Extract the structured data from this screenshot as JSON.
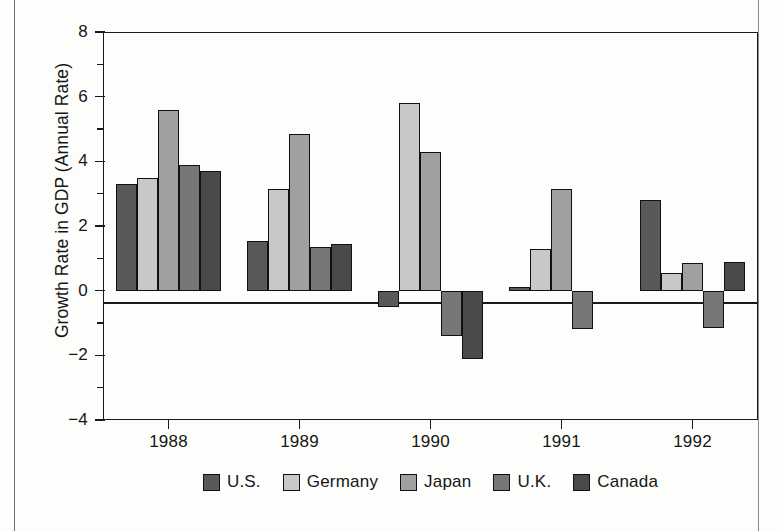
{
  "chart_data": {
    "type": "bar",
    "title": "",
    "xlabel": "",
    "ylabel": "Growth Rate in GDP (Annual Rate)",
    "categories": [
      "1988",
      "1989",
      "1990",
      "1991",
      "1992"
    ],
    "ylim": [
      -4,
      8
    ],
    "y_major_ticks": [
      "8",
      "6",
      "4",
      "2",
      "0",
      "−2",
      "−4"
    ],
    "y_major_values": [
      8,
      6,
      4,
      2,
      0,
      -2,
      -4
    ],
    "y_minor_values": [
      7,
      5,
      3,
      1,
      -1,
      -3
    ],
    "grid": false,
    "legend_position": "bottom",
    "zero_line": true,
    "series": [
      {
        "name": "U.S.",
        "color": "#595959",
        "values": [
          3.3,
          1.55,
          -0.5,
          0.1,
          2.8
        ]
      },
      {
        "name": "Germany",
        "color": "#c8c8c8",
        "values": [
          3.5,
          3.15,
          5.8,
          1.3,
          0.55
        ]
      },
      {
        "name": "Japan",
        "color": "#a0a0a0",
        "values": [
          5.6,
          4.85,
          4.3,
          3.15,
          0.85
        ]
      },
      {
        "name": "U.K.",
        "color": "#777777",
        "values": [
          3.9,
          1.35,
          -1.4,
          -1.2,
          -1.15
        ]
      },
      {
        "name": "Canada",
        "color": "#4a4a4a",
        "values": [
          3.7,
          1.45,
          -2.1,
          0.0,
          0.9
        ]
      }
    ]
  },
  "legend": {
    "items": [
      {
        "label": "U.S."
      },
      {
        "label": "Germany"
      },
      {
        "label": "Japan"
      },
      {
        "label": "U.K."
      },
      {
        "label": "Canada"
      }
    ]
  },
  "colors": {
    "axis": "#1a1a1a",
    "background": "#fdfdfb",
    "frame": "#6e6e6e"
  }
}
